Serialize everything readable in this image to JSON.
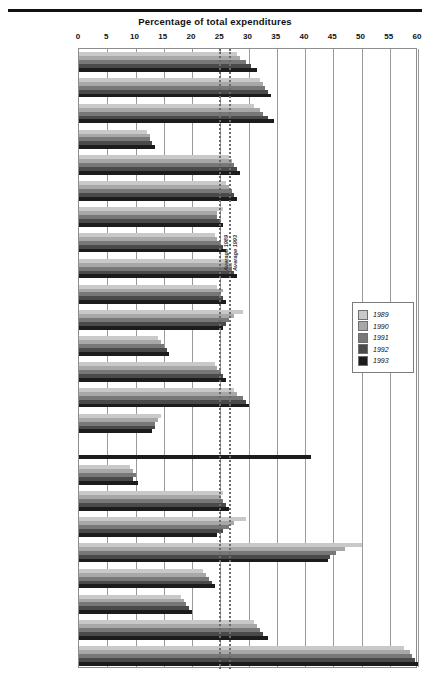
{
  "chart_data": {
    "type": "bar",
    "orientation": "horizontal",
    "title": "Percentage of total expenditures",
    "xlabel": "",
    "ylabel": "",
    "xlim": [
      0,
      60
    ],
    "xticks": [
      0,
      5,
      10,
      15,
      20,
      25,
      30,
      35,
      40,
      45,
      50,
      55,
      60
    ],
    "grid": true,
    "legend_position": "right",
    "categories": [
      "Germany",
      "Australia",
      "Austria",
      "Belgium",
      "Canada",
      "Denmark",
      "Spain",
      "Finland",
      "France",
      "Greece",
      "Ireland",
      "Iceland",
      "Italy",
      "Japan",
      "Luxembourg",
      "Mexico",
      "Norway",
      "New Zealand",
      "Netherlands",
      "Portugal",
      "United Kingdom",
      "Sweden",
      "Switzerland",
      "United States"
    ],
    "series": [
      {
        "name": "1989",
        "color": "#c9c9c9",
        "values": [
          28.0,
          32.0,
          31.0,
          12.0,
          26.5,
          26.0,
          25.5,
          24.0,
          26.5,
          24.5,
          29.0,
          14.0,
          24.0,
          27.5,
          14.5,
          null,
          9.0,
          25.5,
          29.5,
          50.0,
          22.0,
          18.0,
          31.0,
          57.5
        ]
      },
      {
        "name": "1990",
        "color": "#a8a8a8",
        "values": [
          28.5,
          32.5,
          32.0,
          12.5,
          27.0,
          26.5,
          24.5,
          24.5,
          27.0,
          25.5,
          27.5,
          14.5,
          24.5,
          28.0,
          14.0,
          null,
          9.5,
          25.0,
          27.5,
          47.0,
          22.5,
          18.5,
          31.5,
          58.5
        ]
      },
      {
        "name": "1991",
        "color": "#787878",
        "values": [
          29.5,
          33.0,
          32.5,
          12.5,
          27.5,
          27.0,
          24.5,
          25.0,
          27.0,
          25.0,
          26.5,
          15.0,
          25.0,
          29.0,
          13.5,
          null,
          10.0,
          25.5,
          26.5,
          45.5,
          23.0,
          19.0,
          32.0,
          59.0
        ]
      },
      {
        "name": "1992",
        "color": "#4a4a4a",
        "values": [
          30.5,
          33.5,
          33.5,
          13.0,
          28.0,
          27.5,
          25.0,
          25.5,
          27.5,
          25.5,
          26.0,
          15.5,
          25.5,
          29.5,
          13.5,
          null,
          9.5,
          26.0,
          25.5,
          44.5,
          23.5,
          19.5,
          32.5,
          59.5
        ]
      },
      {
        "name": "1993",
        "color": "#1c1c1c",
        "values": [
          31.5,
          34.0,
          34.5,
          13.5,
          28.5,
          28.0,
          25.5,
          26.0,
          28.0,
          26.0,
          25.5,
          16.0,
          26.0,
          30.0,
          13.0,
          41.0,
          10.5,
          26.5,
          24.5,
          44.0,
          24.0,
          20.0,
          33.5,
          60.0
        ]
      }
    ],
    "reference_lines": [
      {
        "label": "Average 1989",
        "value": 24.8
      },
      {
        "label": "Average 1993",
        "value": 26.5
      }
    ],
    "legend": [
      {
        "label": "1989",
        "color": "#c9c9c9"
      },
      {
        "label": "1990",
        "color": "#a8a8a8"
      },
      {
        "label": "1991",
        "color": "#787878"
      },
      {
        "label": "1992",
        "color": "#4a4a4a"
      },
      {
        "label": "1993",
        "color": "#1c1c1c"
      }
    ]
  }
}
